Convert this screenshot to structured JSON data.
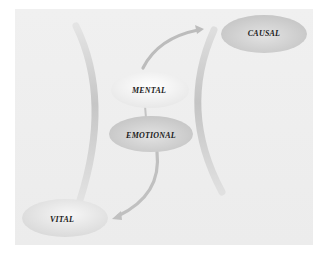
{
  "diagram": {
    "nodes": [
      {
        "id": "causal",
        "label": "CAUSAL"
      },
      {
        "id": "mental",
        "label": "MENTAL"
      },
      {
        "id": "emotional",
        "label": "EMOTIONAL"
      },
      {
        "id": "vital",
        "label": "VITAL"
      }
    ],
    "edges": [
      {
        "from": "mental",
        "to": "causal",
        "type": "curved-arrow"
      },
      {
        "from": "emotional",
        "to": "vital",
        "type": "curved-arrow"
      },
      {
        "from": "mental",
        "to": "emotional",
        "type": "connector"
      }
    ],
    "colors": {
      "background": "#ececec",
      "arc": "#c8c8c8",
      "ellipse_dark": "#cfcfcf",
      "ellipse_light": "#f7f7f7",
      "arrow": "#bdbdbd",
      "text": "#1a1a1a"
    }
  }
}
